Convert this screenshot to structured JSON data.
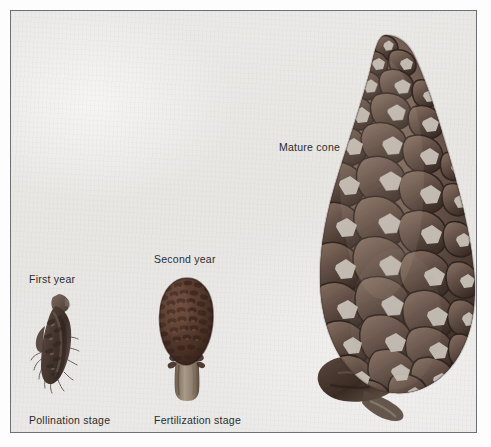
{
  "figure": {
    "background_color": "#e9e8e6",
    "frame_border_color": "#6f7073",
    "page_background_color": "#ffffff",
    "text_color": "#2b2b2d"
  },
  "labels": {
    "first_year": "First year",
    "second_year": "Second year",
    "mature_cone": "Mature cone",
    "pollination_stage": "Pollination stage",
    "fertilization_stage": "Fertilization stage"
  },
  "specimens": [
    {
      "id": "first-year",
      "top_label": "First year",
      "bottom_label": "Pollination stage",
      "description": "small slender immature conelet, tilted, with wispy bract fringes",
      "scale_color": "#5a4a42",
      "shadow_color": "#3a2f2b"
    },
    {
      "id": "second-year",
      "top_label": "Second year",
      "bottom_label": "Fertilization stage",
      "description": "ovoid cone with dense fine scale rows and a pale stalk",
      "scale_color": "#5c4034",
      "shadow_color": "#38241d"
    },
    {
      "id": "mature-cone",
      "top_label": "Mature cone",
      "bottom_label": "",
      "description": "large ovoid mature cone with rhomboid woody scales and light gray umbo centers",
      "scale_color": "#6b574e",
      "shadow_color": "#3b2d27",
      "umbo_color": "#cdc6bd"
    }
  ]
}
